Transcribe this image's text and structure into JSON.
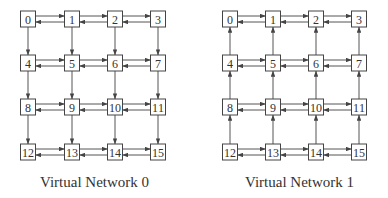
{
  "diagram": {
    "networks": [
      {
        "id": "vn0",
        "caption": "Virtual Network 0",
        "vertical_direction": "down",
        "nodes": [
          "0",
          "1",
          "2",
          "3",
          "4",
          "5",
          "6",
          "7",
          "8",
          "9",
          "10",
          "11",
          "12",
          "13",
          "14",
          "15"
        ],
        "column_x": [
          28,
          72,
          115,
          158
        ],
        "row_y": [
          19,
          63,
          107,
          152
        ],
        "caption_pos": {
          "x": 40,
          "y": 174
        }
      },
      {
        "id": "vn1",
        "caption": "Virtual Network 1",
        "vertical_direction": "up",
        "nodes": [
          "0",
          "1",
          "2",
          "3",
          "4",
          "5",
          "6",
          "7",
          "8",
          "9",
          "10",
          "11",
          "12",
          "13",
          "14",
          "15"
        ],
        "column_x": [
          230,
          273,
          316,
          359
        ],
        "row_y": [
          19,
          63,
          107,
          152
        ],
        "caption_pos": {
          "x": 245,
          "y": 174
        }
      }
    ],
    "horizontal_links": "bidirectional",
    "colors": {
      "stroke": "#555555",
      "text": "#333333",
      "background": "#ffffff"
    }
  }
}
